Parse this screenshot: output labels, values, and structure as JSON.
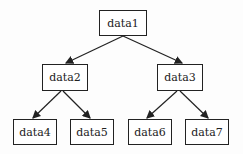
{
  "diagram": {
    "type": "binary-tree",
    "nodes": [
      {
        "id": "data1",
        "label": "data1",
        "x": 99,
        "y": 10,
        "w": 48,
        "h": 26
      },
      {
        "id": "data2",
        "label": "data2",
        "x": 42,
        "y": 64,
        "w": 46,
        "h": 27
      },
      {
        "id": "data3",
        "label": "data3",
        "x": 157,
        "y": 64,
        "w": 46,
        "h": 27
      },
      {
        "id": "data4",
        "label": "data4",
        "x": 13,
        "y": 119,
        "w": 44,
        "h": 26
      },
      {
        "id": "data5",
        "label": "data5",
        "x": 70,
        "y": 119,
        "w": 44,
        "h": 26
      },
      {
        "id": "data6",
        "label": "data6",
        "x": 128,
        "y": 119,
        "w": 44,
        "h": 26
      },
      {
        "id": "data7",
        "label": "data7",
        "x": 185,
        "y": 119,
        "w": 44,
        "h": 26
      }
    ],
    "edges": [
      {
        "from": "data1",
        "to": "data2"
      },
      {
        "from": "data1",
        "to": "data3"
      },
      {
        "from": "data2",
        "to": "data4"
      },
      {
        "from": "data2",
        "to": "data5"
      },
      {
        "from": "data3",
        "to": "data6"
      },
      {
        "from": "data3",
        "to": "data7"
      }
    ],
    "colors": {
      "stroke": "#222222",
      "background": "#fdfdfd"
    }
  }
}
